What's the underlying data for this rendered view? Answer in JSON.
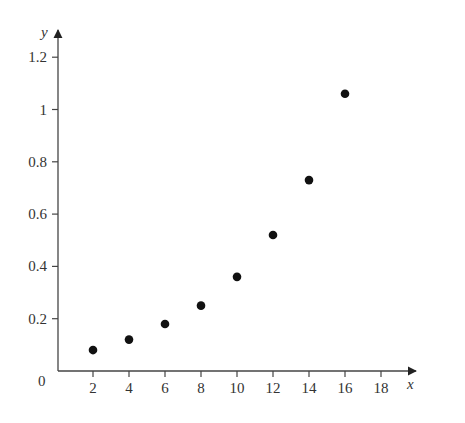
{
  "chart_data": {
    "type": "scatter",
    "title": "",
    "xlabel": "x",
    "ylabel": "y",
    "origin_label": "0",
    "x": [
      2,
      4,
      6,
      8,
      10,
      12,
      14,
      16
    ],
    "y": [
      0.08,
      0.12,
      0.18,
      0.25,
      0.36,
      0.52,
      0.73,
      1.06
    ],
    "x_ticks": [
      2,
      4,
      6,
      8,
      10,
      12,
      14,
      16,
      18
    ],
    "x_tick_labels": [
      "2",
      "4",
      "6",
      "8",
      "10",
      "12",
      "14",
      "16",
      "18"
    ],
    "y_ticks": [
      0.2,
      0.4,
      0.6,
      0.8,
      1,
      1.2
    ],
    "y_tick_labels": [
      "0.2",
      "0.4",
      "0.6",
      "0.8",
      "1",
      "1.2"
    ],
    "xlim": [
      0,
      19
    ],
    "ylim": [
      0,
      1.3
    ],
    "grid": false,
    "legend": null,
    "colors": {
      "axis": "#444444",
      "marker": "#111111"
    }
  }
}
